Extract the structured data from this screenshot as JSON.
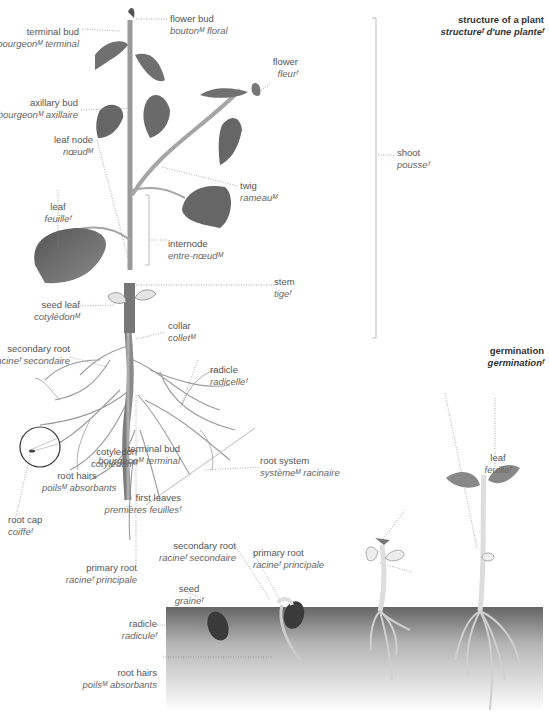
{
  "sections": {
    "structure": {
      "en": "structure of a plant",
      "fr": "structureᶠ d'une planteᶠ"
    },
    "germination": {
      "en": "germination",
      "fr": "germinationᶠ"
    }
  },
  "structure_labels": {
    "flower_bud": {
      "en": "flower bud",
      "fr": "boutonᴹ floral"
    },
    "terminal_bud": {
      "en": "terminal bud",
      "fr": "bourgeonᴹ terminal"
    },
    "flower": {
      "en": "flower",
      "fr": "fleurᶠ"
    },
    "axillary_bud": {
      "en": "axillary bud",
      "fr": "bourgeonᴹ axillaire"
    },
    "leaf_node": {
      "en": "leaf node",
      "fr": "nœudᴹ"
    },
    "shoot": {
      "en": "shoot",
      "fr": "pousseᶠ"
    },
    "twig": {
      "en": "twig",
      "fr": "rameauᴹ"
    },
    "leaf": {
      "en": "leaf",
      "fr": "feuilleᶠ"
    },
    "internode": {
      "en": "internode",
      "fr": "entre-nœudᴹ"
    },
    "stem": {
      "en": "stem",
      "fr": "tigeᶠ"
    },
    "seed_leaf": {
      "en": "seed leaf",
      "fr": "cotylédonᴹ"
    },
    "collar": {
      "en": "collar",
      "fr": "colletᴹ"
    },
    "secondary_root": {
      "en": "secondary root",
      "fr": "racineᶠ secondaire"
    },
    "radicle": {
      "en": "radicle",
      "fr": "radicelleᶠ"
    },
    "root_hairs": {
      "en": "root hairs",
      "fr": "poilsᴹ absorbants"
    },
    "root_system": {
      "en": "root system",
      "fr": "systèmeᴹ racinaire"
    },
    "root_cap": {
      "en": "root cap",
      "fr": "coiffeᶠ"
    },
    "primary_root": {
      "en": "primary root",
      "fr": "racineᶠ principale"
    }
  },
  "germination_labels": {
    "terminal_bud": {
      "en": "terminal bud",
      "fr": "bourgeonᴹ terminal"
    },
    "leaf": {
      "en": "leaf",
      "fr": "feuilleᶠ"
    },
    "cotyledon": {
      "en": "cotyledon",
      "fr": "cotylédonᴹ"
    },
    "first_leaves": {
      "en": "first leaves",
      "fr": "premières feuillesᶠ"
    },
    "secondary_root": {
      "en": "secondary root",
      "fr": "racineᶠ secondaire"
    },
    "primary_root": {
      "en": "primary root",
      "fr": "racineᶠ principale"
    },
    "seed": {
      "en": "seed",
      "fr": "graineᶠ"
    },
    "radicle": {
      "en": "radicle",
      "fr": "radiculeᶠ"
    },
    "root_hairs": {
      "en": "root hairs",
      "fr": "poilsᴹ absorbants"
    }
  },
  "colors": {
    "leaf": "#6e6e6e",
    "stem": "#9a9a9a",
    "soil_top": "#6a6a6a",
    "soil_bottom": "#ffffff",
    "leader": "#999999"
  }
}
